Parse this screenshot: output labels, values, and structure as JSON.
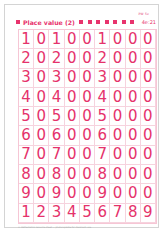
{
  "worksheet": {
    "code": "PW 5v",
    "title": "Place value (2)",
    "reference": "4e:21",
    "accent_color": "#e8336d",
    "rows": [
      [
        "1",
        "0",
        "1",
        "0",
        "0",
        "1",
        "0",
        "0",
        "0"
      ],
      [
        "2",
        "0",
        "2",
        "0",
        "0",
        "2",
        "0",
        "0",
        "0"
      ],
      [
        "3",
        "0",
        "3",
        "0",
        "0",
        "3",
        "0",
        "0",
        "0"
      ],
      [
        "4",
        "0",
        "4",
        "0",
        "0",
        "4",
        "0",
        "0",
        "0"
      ],
      [
        "5",
        "0",
        "5",
        "0",
        "0",
        "5",
        "0",
        "0",
        "0"
      ],
      [
        "6",
        "0",
        "6",
        "0",
        "0",
        "6",
        "0",
        "0",
        "0"
      ],
      [
        "7",
        "0",
        "7",
        "0",
        "0",
        "7",
        "0",
        "0",
        "0"
      ],
      [
        "8",
        "0",
        "8",
        "0",
        "0",
        "8",
        "0",
        "0",
        "0"
      ],
      [
        "9",
        "0",
        "9",
        "0",
        "0",
        "9",
        "0",
        "0",
        "0"
      ],
      [
        "1",
        "2",
        "3",
        "4",
        "5",
        "6",
        "7",
        "8",
        "9"
      ]
    ],
    "footer": "© Mathematics resource sheet — photocopiable for classroom use"
  }
}
